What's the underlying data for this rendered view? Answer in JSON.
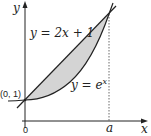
{
  "diagram": {
    "axes": {
      "x_label": "x",
      "y_label": "y",
      "origin_label": "0",
      "a_label": "a"
    },
    "curves": [
      {
        "name": "line",
        "label": "y = 2x + 1"
      },
      {
        "name": "exponential",
        "label": "y = e",
        "label_sup": "x"
      }
    ],
    "points": [
      {
        "label": "(0, 1)"
      }
    ],
    "region": {
      "fill": "#d4d4d4",
      "description": "shaded area between y = 2x + 1 and y = e^x from 0 to a"
    },
    "colors": {
      "stroke": "#222222",
      "shade": "#d4d4d4"
    }
  }
}
